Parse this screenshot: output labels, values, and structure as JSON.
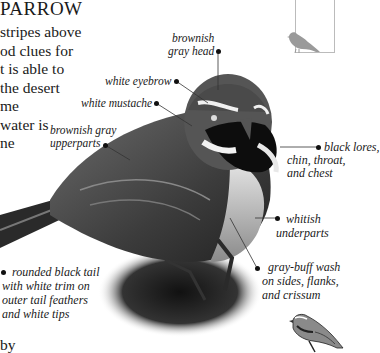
{
  "page": {
    "title_fragment": "PARROW",
    "body_lines": [
      "stripes above",
      "od clues for",
      "t is able to",
      "the desert",
      "me",
      "water is",
      "ne"
    ],
    "bottom_fragment": "by"
  },
  "labels": {
    "head": [
      "brownish",
      "gray head"
    ],
    "eyebrow": "white eyebrow",
    "mustache": "white mustache",
    "upperparts": [
      "brownish gray",
      "upperparts"
    ],
    "lores": [
      "black lores,",
      "chin, throat,",
      "and chest"
    ],
    "underparts": [
      "whitish",
      "underparts"
    ],
    "sides": [
      "gray-buff wash",
      "on sides, flanks,",
      "and crissum"
    ],
    "tail": [
      "rounded black tail",
      "with white trim on",
      "outer tail feathers",
      "and white tips"
    ]
  },
  "icons": {
    "range_map_bird": "bird-silhouette-icon",
    "small_illustration": "bird-illustration-icon"
  }
}
